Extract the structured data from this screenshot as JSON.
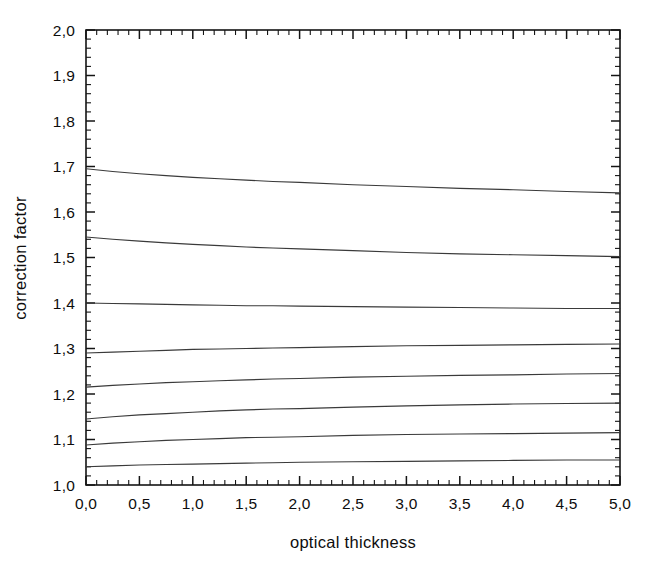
{
  "chart_data": {
    "type": "line",
    "title": "",
    "xlabel": "optical thickness",
    "ylabel": "correction factor",
    "xlim": [
      0.0,
      5.0
    ],
    "ylim": [
      1.0,
      2.0
    ],
    "grid": false,
    "legend": "none",
    "decimal_separator": ",",
    "x_tick_labels": [
      "0,0",
      "0,5",
      "1,0",
      "1,5",
      "2,0",
      "2,5",
      "3,0",
      "3,5",
      "4,0",
      "4,5",
      "5,0"
    ],
    "x_tick_values": [
      0.0,
      0.5,
      1.0,
      1.5,
      2.0,
      2.5,
      3.0,
      3.5,
      4.0,
      4.5,
      5.0
    ],
    "x_minor_step": 0.1,
    "y_tick_labels": [
      "1,0",
      "1,1",
      "1,2",
      "1,3",
      "1,4",
      "1,5",
      "1,6",
      "1,7",
      "1,8",
      "1,9",
      "2,0"
    ],
    "y_tick_values": [
      1.0,
      1.1,
      1.2,
      1.3,
      1.4,
      1.5,
      1.6,
      1.7,
      1.8,
      1.9,
      2.0
    ],
    "y_minor_step": 0.02,
    "axes_box": "all-four-sides-with-inward-ticks",
    "line_color": "#3a3a3a",
    "x": [
      0.0,
      0.25,
      0.5,
      0.75,
      1.0,
      1.25,
      1.5,
      1.75,
      2.0,
      2.5,
      3.0,
      3.5,
      4.0,
      4.5,
      5.0
    ],
    "series": [
      {
        "name": "curve-1",
        "values": [
          1.695,
          1.689,
          1.684,
          1.68,
          1.676,
          1.673,
          1.67,
          1.667,
          1.665,
          1.66,
          1.656,
          1.652,
          1.649,
          1.645,
          1.642
        ]
      },
      {
        "name": "curve-2",
        "values": [
          1.545,
          1.54,
          1.536,
          1.532,
          1.529,
          1.526,
          1.523,
          1.521,
          1.519,
          1.515,
          1.511,
          1.508,
          1.506,
          1.504,
          1.502
        ]
      },
      {
        "name": "curve-3",
        "values": [
          1.4,
          1.399,
          1.398,
          1.397,
          1.396,
          1.395,
          1.394,
          1.394,
          1.393,
          1.392,
          1.391,
          1.39,
          1.389,
          1.388,
          1.388
        ]
      },
      {
        "name": "curve-4",
        "values": [
          1.29,
          1.292,
          1.294,
          1.296,
          1.298,
          1.299,
          1.3,
          1.301,
          1.302,
          1.304,
          1.306,
          1.307,
          1.308,
          1.309,
          1.31
        ]
      },
      {
        "name": "curve-5",
        "values": [
          1.215,
          1.219,
          1.222,
          1.225,
          1.227,
          1.229,
          1.231,
          1.233,
          1.234,
          1.237,
          1.239,
          1.241,
          1.242,
          1.244,
          1.245
        ]
      },
      {
        "name": "curve-6",
        "values": [
          1.145,
          1.15,
          1.154,
          1.157,
          1.16,
          1.163,
          1.165,
          1.167,
          1.168,
          1.171,
          1.174,
          1.176,
          1.178,
          1.179,
          1.18
        ]
      },
      {
        "name": "curve-7",
        "values": [
          1.088,
          1.092,
          1.095,
          1.098,
          1.1,
          1.102,
          1.104,
          1.105,
          1.106,
          1.109,
          1.111,
          1.112,
          1.113,
          1.114,
          1.115
        ]
      },
      {
        "name": "curve-8",
        "values": [
          1.04,
          1.042,
          1.044,
          1.045,
          1.046,
          1.047,
          1.048,
          1.049,
          1.05,
          1.051,
          1.052,
          1.053,
          1.054,
          1.055,
          1.055
        ]
      }
    ]
  }
}
